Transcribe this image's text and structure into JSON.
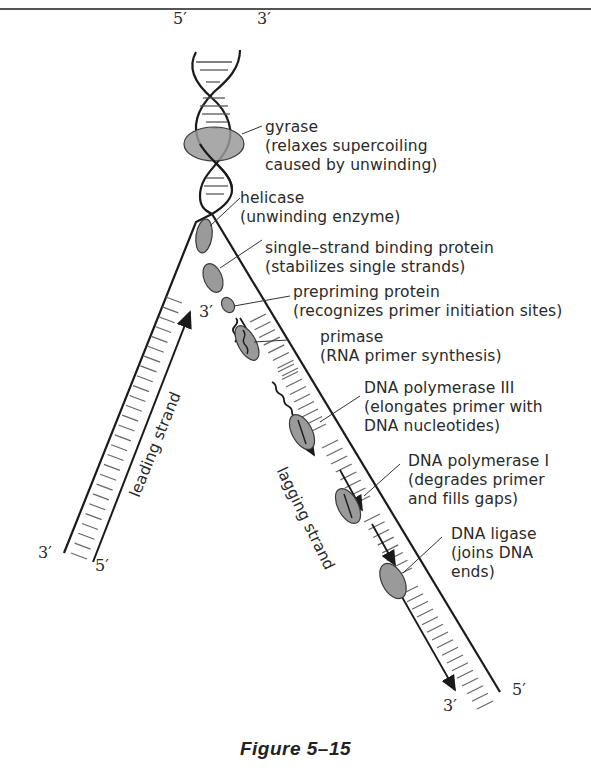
{
  "figure": {
    "caption": "Figure 5–15"
  },
  "strand_ends": {
    "top_left": "5′",
    "top_right": "3′",
    "fork_3prime": "3′",
    "bottom_left_outer": "3′",
    "bottom_left_inner": "5′",
    "bottom_right_inner": "3′",
    "bottom_right_outer": "5′"
  },
  "strand_labels": {
    "leading": "leading strand",
    "lagging": "lagging strand"
  },
  "labels": [
    {
      "name": "gyrase",
      "lines": [
        "gyrase",
        "(relaxes supercoiling",
        "caused by unwinding)"
      ]
    },
    {
      "name": "helicase",
      "lines": [
        "helicase",
        "(unwinding enzyme)"
      ]
    },
    {
      "name": "ssb",
      "lines": [
        "single–strand binding protein",
        "(stabilizes single strands)"
      ]
    },
    {
      "name": "prepriming",
      "lines": [
        "prepriming protein",
        "(recognizes primer initiation sites)"
      ]
    },
    {
      "name": "primase",
      "lines": [
        "primase",
        "(RNA primer synthesis)"
      ]
    },
    {
      "name": "pol3",
      "lines": [
        "DNA polymerase III",
        "(elongates primer with",
        "DNA nucleotides)"
      ]
    },
    {
      "name": "pol1",
      "lines": [
        "DNA polymerase I",
        "(degrades primer",
        "and fills gaps)"
      ]
    },
    {
      "name": "ligase",
      "lines": [
        "DNA ligase",
        "(joins DNA",
        "ends)"
      ]
    }
  ],
  "colors": {
    "strand": "#1a1a1a",
    "enzyme_fill": "#9a9a9a",
    "enzyme_stroke": "#3a3a3a",
    "rung": "#555555"
  }
}
